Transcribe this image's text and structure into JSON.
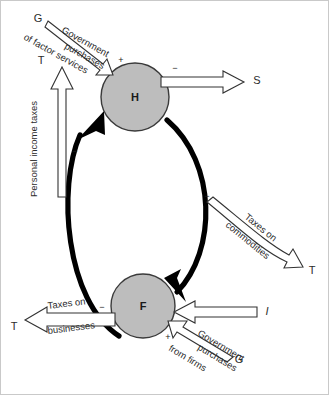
{
  "figure": {
    "type": "economic-circular-flow-diagram",
    "background_color": "#ffffff",
    "node_fill_color": "#bdbdbd",
    "node_stroke_color": "#3a3a3a",
    "flow_color": "#000000"
  },
  "nodes": [
    {
      "id": "H",
      "label": "H",
      "meaning": "Households",
      "cx": 134,
      "cy": 96,
      "r": 34
    },
    {
      "id": "F",
      "label": "F",
      "meaning": "Firms",
      "cx": 142,
      "cy": 305,
      "r": 32
    }
  ],
  "endpoints": {
    "g_factor": "G",
    "t_income": "T",
    "s_saving": "S",
    "t_commodities": "T",
    "i_investment": "I",
    "g_firms": "G",
    "t_business": "T"
  },
  "flows": [
    {
      "id": "government-purchases-factor-services",
      "label_lines": [
        "Government",
        "purchases",
        "of factor services"
      ],
      "from": "G",
      "to": "H",
      "sign": "+",
      "style": "outline-arrow"
    },
    {
      "id": "personal-income-taxes",
      "label_lines": [
        "Personal income taxes"
      ],
      "from": "circular-flow-left",
      "to": "T",
      "sign": "−",
      "style": "outline-arrow",
      "orientation": "vertical"
    },
    {
      "id": "saving",
      "label_lines": [],
      "from": "H",
      "to": "S",
      "sign": "−",
      "style": "outline-arrow",
      "orientation": "horizontal"
    },
    {
      "id": "taxes-on-commodities",
      "label_lines": [
        "Taxes on",
        "commodities"
      ],
      "from": "circular-flow-right",
      "to": "T",
      "sign": "−",
      "style": "outline-arrow"
    },
    {
      "id": "investment",
      "label_lines": [],
      "from": "I",
      "to": "F",
      "sign": "+",
      "style": "outline-arrow",
      "orientation": "horizontal"
    },
    {
      "id": "government-purchases-from-firms",
      "label_lines": [
        "Government",
        "purchases",
        "from firms"
      ],
      "from": "G",
      "to": "F",
      "sign": "+",
      "style": "outline-arrow"
    },
    {
      "id": "taxes-on-businesses",
      "label_lines": [
        "Taxes on",
        "businesses"
      ],
      "from": "F",
      "to": "T",
      "sign": "−",
      "style": "outline-arrow"
    }
  ],
  "signs": {
    "plus": "+",
    "minus": "−"
  },
  "labels": {
    "gov_line1": "Government",
    "gov_line2": "purchases",
    "gov_line3": "of factor services",
    "income_tax": "Personal income taxes",
    "tax_comm_line1": "Taxes on",
    "tax_comm_line2": "commodities",
    "gov_firms_line1": "Government",
    "gov_firms_line2": "purchases",
    "gov_firms_line3": "from firms",
    "tax_bus_line1": "Taxes on",
    "tax_bus_line2": "businesses"
  }
}
